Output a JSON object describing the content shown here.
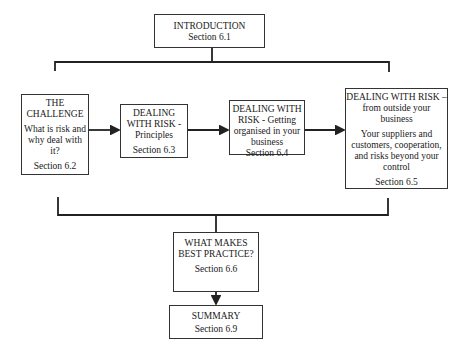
{
  "diagram": {
    "nodes": [
      {
        "id": "intro",
        "title_lines": [
          "INTRODUCTION"
        ],
        "desc_lines": [],
        "section": "Section 6.1"
      },
      {
        "id": "challenge",
        "title_lines": [
          "THE",
          "CHALLENGE"
        ],
        "desc_lines": [
          "What is risk and",
          "why deal with",
          "it?"
        ],
        "section": "Section 6.2"
      },
      {
        "id": "principles",
        "title_lines": [
          "DEALING",
          "WITH RISK -",
          "Principles"
        ],
        "desc_lines": [],
        "section": "Section 6.3"
      },
      {
        "id": "organised",
        "title_lines": [
          "DEALING WITH",
          "RISK - Getting",
          "organised in your",
          "business"
        ],
        "desc_lines": [],
        "section": "Section 6.4"
      },
      {
        "id": "outside",
        "title_lines": [
          "DEALING WITH RISK –",
          "from outside your",
          "business"
        ],
        "desc_lines": [
          "Your suppliers and",
          "customers, cooperation,",
          "and risks beyond your",
          "control"
        ],
        "section": "Section 6.5"
      },
      {
        "id": "best",
        "title_lines": [
          "WHAT MAKES",
          "BEST PRACTICE?"
        ],
        "desc_lines": [],
        "section": "Section 6.6"
      },
      {
        "id": "summary",
        "title_lines": [
          "SUMMARY"
        ],
        "desc_lines": [],
        "section": "Section 6.9"
      }
    ],
    "edges": [
      {
        "from": "intro",
        "to": "bracket-top",
        "type": "line"
      },
      {
        "from": "challenge",
        "to": "principles",
        "type": "arrow"
      },
      {
        "from": "principles",
        "to": "organised",
        "type": "arrow"
      },
      {
        "from": "organised",
        "to": "outside",
        "type": "arrow"
      },
      {
        "from": "bracket-bottom",
        "to": "best",
        "type": "line"
      },
      {
        "from": "best",
        "to": "summary",
        "type": "arrow"
      }
    ]
  }
}
